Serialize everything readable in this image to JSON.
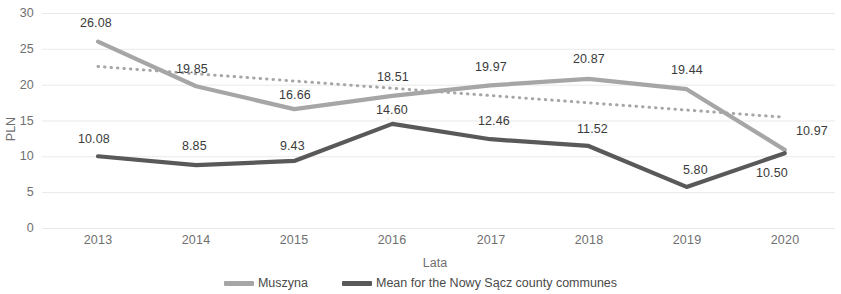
{
  "chart_data": {
    "type": "line",
    "title": "",
    "xlabel": "Lata",
    "ylabel": "PLN",
    "categories": [
      "2013",
      "2014",
      "2015",
      "2016",
      "2017",
      "2018",
      "2019",
      "2020"
    ],
    "ylim": [
      0,
      30
    ],
    "ytick_step": 5,
    "yticks": [
      "30",
      "25",
      "20",
      "15",
      "10",
      "5",
      "0"
    ],
    "grid": true,
    "grid_axis": "y",
    "legend_position": "bottom",
    "series": [
      {
        "name": "Muszyna",
        "color": "#a6a6a6",
        "style": "solid",
        "values": [
          26.08,
          19.85,
          16.66,
          18.51,
          19.97,
          20.87,
          19.44,
          10.97
        ],
        "labels": [
          "26.08",
          "19.85",
          "16.66",
          "18.51",
          "19.97",
          "20.87",
          "19.44",
          "10.97"
        ]
      },
      {
        "name": "Mean for the Nowy Sącz county communes",
        "color": "#595959",
        "style": "solid",
        "values": [
          10.08,
          8.85,
          9.43,
          14.6,
          12.46,
          11.52,
          5.8,
          10.5
        ],
        "labels": [
          "10.08",
          "8.85",
          "9.43",
          "14.60",
          "12.46",
          "11.52",
          "5.80",
          "10.50"
        ]
      },
      {
        "name": "trendline",
        "color": "#a6a6a6",
        "style": "dotted",
        "values": [
          22.6,
          21.59,
          20.58,
          19.57,
          18.55,
          17.54,
          16.53,
          15.52
        ],
        "labels": []
      }
    ]
  },
  "axis": {
    "y_title": "PLN",
    "x_title": "Lata"
  },
  "legend": {
    "items": [
      {
        "label": "Muszyna",
        "color": "#a6a6a6"
      },
      {
        "label": "Mean for the Nowy Sącz county communes",
        "color": "#595959"
      }
    ]
  },
  "yticks": {
    "t0": "30",
    "t1": "25",
    "t2": "20",
    "t3": "15",
    "t4": "10",
    "t5": "5",
    "t6": "0"
  },
  "xticks": {
    "t0": "2013",
    "t1": "2014",
    "t2": "2015",
    "t3": "2016",
    "t4": "2017",
    "t5": "2018",
    "t6": "2019",
    "t7": "2020"
  },
  "labels_muszyna": {
    "v0": "26.08",
    "v1": "19.85",
    "v2": "16.66",
    "v3": "18.51",
    "v4": "19.97",
    "v5": "20.87",
    "v6": "19.44",
    "v7": "10.97"
  },
  "labels_mean": {
    "v0": "10.08",
    "v1": "8.85",
    "v2": "9.43",
    "v3": "14.60",
    "v4": "12.46",
    "v5": "11.52",
    "v6": "5.80",
    "v7": "10.50"
  }
}
